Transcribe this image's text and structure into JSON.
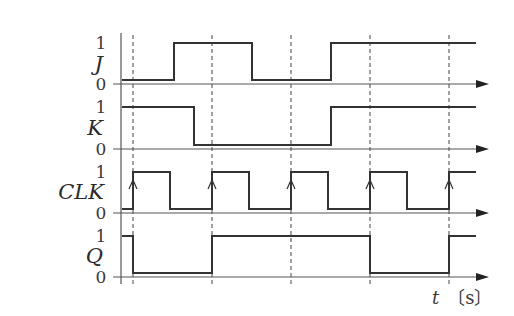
{
  "x_axis": {
    "variable": "t",
    "unit": "〔s〕"
  },
  "clock_edges_x": [
    133,
    212,
    291,
    370,
    449
  ],
  "signals": [
    {
      "name": "J",
      "high_label": "1",
      "low_label": "0",
      "y_high": 43,
      "y_low": 80,
      "y_axis": 84,
      "label_y": 71,
      "initial": 0,
      "transitions": [
        174,
        252,
        331
      ]
    },
    {
      "name": "K",
      "high_label": "1",
      "low_label": "0",
      "y_high": 107,
      "y_low": 145,
      "y_axis": 149,
      "label_y": 135,
      "initial": 1,
      "transitions": [
        194,
        331
      ]
    },
    {
      "name": "CLK",
      "high_label": "1",
      "low_label": "0",
      "y_high": 172,
      "y_low": 209,
      "y_axis": 213,
      "label_y": 199,
      "initial": 0,
      "transitions": [
        133,
        170,
        212,
        249,
        291,
        328,
        370,
        407,
        449
      ]
    },
    {
      "name": "Q",
      "high_label": "1",
      "low_label": "0",
      "y_high": 236,
      "y_low": 273,
      "y_axis": 277,
      "label_y": 263,
      "initial": 1,
      "transitions": [
        133,
        212,
        370,
        449
      ]
    }
  ],
  "geometry": {
    "axis_x": 121,
    "axis_top": 33,
    "axis_bottom": 284,
    "wave_start": 122,
    "wave_end": 476,
    "arrow_end": 489,
    "hline_start": 113,
    "dash_top": 35,
    "dash_bottom": 284
  },
  "chart_data": {
    "type": "line",
    "title": "",
    "xlabel": "t 〔s〕",
    "ylabel": "",
    "series": [
      {
        "name": "J",
        "levels": [
          0,
          1,
          0,
          1
        ],
        "change_at_clock_fraction": [
          0.52,
          1.5,
          2.5
        ]
      },
      {
        "name": "K",
        "levels": [
          1,
          0,
          1
        ],
        "change_at_clock_fraction": [
          0.77,
          2.5
        ]
      },
      {
        "name": "CLK",
        "levels": [
          0,
          1,
          0,
          1,
          0,
          1,
          0,
          1,
          0,
          1
        ],
        "rising_edges": 5
      },
      {
        "name": "Q",
        "levels": [
          1,
          0,
          1,
          0,
          1
        ],
        "change_at_clock_edge": [
          1,
          2,
          4,
          5
        ]
      }
    ],
    "y_levels": [
      "0",
      "1"
    ],
    "clock_edges_marked": 5
  }
}
